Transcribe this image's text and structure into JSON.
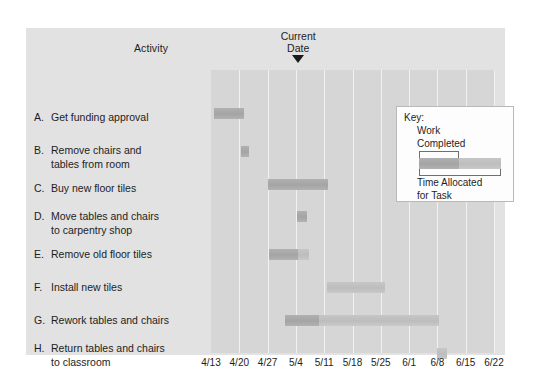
{
  "chart_data": {
    "type": "bar",
    "chart_kind": "gantt",
    "title": "",
    "xlabel": "",
    "ylabel": "Activity",
    "grid": true,
    "x_axis": {
      "tick_labels": [
        "4/13",
        "4/20",
        "4/27",
        "5/4",
        "5/11",
        "5/18",
        "5/25",
        "6/1",
        "6/8",
        "6/15",
        "6/22"
      ],
      "tick_positions_pct": [
        0,
        10,
        20,
        30,
        40,
        50,
        60,
        70,
        80,
        90,
        100
      ],
      "range": [
        "4/13",
        "6/22"
      ],
      "interval": "weekly"
    },
    "current_date": {
      "label_line1": "Current",
      "label_line2": "Date",
      "value": "5/11",
      "position_pct": 40,
      "marker": "down-triangle"
    },
    "categories": [
      {
        "letter": "A.",
        "label_line1": "Get funding approval",
        "label_line2": ""
      },
      {
        "letter": "B.",
        "label_line1": "Remove chairs and",
        "label_line2": "tables from room"
      },
      {
        "letter": "C.",
        "label_line1": "Buy new floor tiles",
        "label_line2": ""
      },
      {
        "letter": "D.",
        "label_line1": "Move tables and chairs",
        "label_line2": "to carpentry shop"
      },
      {
        "letter": "E.",
        "label_line1": "Remove old floor tiles",
        "label_line2": ""
      },
      {
        "letter": "F.",
        "label_line1": "Install new tiles",
        "label_line2": ""
      },
      {
        "letter": "G.",
        "label_line1": "Rework tables and chairs",
        "label_line2": ""
      },
      {
        "letter": "H.",
        "label_line1": "Return tables and chairs",
        "label_line2": "to classroom"
      },
      {
        "letter": "I.",
        "label_line1": "Reinstall tables and chairs",
        "label_line2": ""
      }
    ],
    "tasks": [
      {
        "id": "A",
        "start": "4/13",
        "end": "4/20",
        "start_pct": 1.0,
        "end_pct": 11.5,
        "completed_pct_of_bar": 100,
        "row_top": 38
      },
      {
        "id": "B",
        "start": "4/20",
        "end": "4/22",
        "start_pct": 10.5,
        "end_pct": 13.5,
        "completed_pct_of_bar": 100,
        "row_top": 76
      },
      {
        "id": "C",
        "start": "4/27",
        "end": "5/11",
        "start_pct": 20.0,
        "end_pct": 41.5,
        "completed_pct_of_bar": 100,
        "row_top": 109
      },
      {
        "id": "D",
        "start": "5/4",
        "end": "5/6",
        "start_pct": 30.5,
        "end_pct": 34.0,
        "completed_pct_of_bar": 100,
        "row_top": 141
      },
      {
        "id": "E",
        "start": "4/27",
        "end": "5/8",
        "start_pct": 20.5,
        "end_pct": 34.5,
        "completed_pct_of_bar": 74,
        "row_top": 179
      },
      {
        "id": "F",
        "start": "5/11",
        "end": "5/25",
        "start_pct": 41.0,
        "end_pct": 61.5,
        "completed_pct_of_bar": 0,
        "row_top": 212
      },
      {
        "id": "G",
        "start": "5/1",
        "end": "6/8",
        "start_pct": 26.0,
        "end_pct": 80.5,
        "completed_pct_of_bar": 22,
        "row_top": 245
      },
      {
        "id": "H",
        "start": "6/8",
        "end": "6/10",
        "start_pct": 80.0,
        "end_pct": 83.5,
        "completed_pct_of_bar": 0,
        "row_top": 278
      },
      {
        "id": "I",
        "start": "6/12",
        "end": "6/19",
        "start_pct": 85.0,
        "end_pct": 95.5,
        "completed_pct_of_bar": 0,
        "row_top": 311
      }
    ],
    "legend": {
      "title": "Key:",
      "work_completed_line1": "Work",
      "work_completed_line2": "Completed",
      "time_allocated_line1": "Time Allocated",
      "time_allocated_line2": "for Task"
    },
    "colors": {
      "panel_background": "#e2e2e2",
      "plot_background": "#d6d6d6",
      "gridline": "#f2f2f2",
      "bar_allocated": "#c3c3c3",
      "bar_completed": "#a8a8a8",
      "text": "#1d1d1d",
      "legend_background": "#fdfdfd",
      "legend_border": "#b9b9b9"
    }
  },
  "header": {
    "activity_column_label": "Activity"
  }
}
